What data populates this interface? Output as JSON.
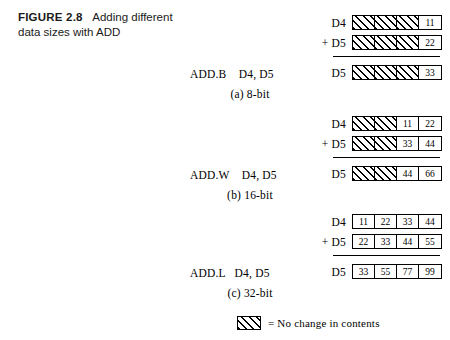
{
  "figure": {
    "number_label": "FIGURE 2.8",
    "caption_text": "Adding different data sizes with ADD"
  },
  "groups": [
    {
      "id": "8-bit",
      "mnemonic": "ADD.B    D4, D5",
      "subcaption": "(a) 8-bit",
      "rows": [
        {
          "label": "D4",
          "cells": [
            {
              "value": "",
              "hatched": true
            },
            {
              "value": "",
              "hatched": true
            },
            {
              "value": "",
              "hatched": true
            },
            {
              "value": "11",
              "hatched": false
            }
          ]
        },
        {
          "label": "+ D5",
          "cells": [
            {
              "value": "",
              "hatched": true
            },
            {
              "value": "",
              "hatched": true
            },
            {
              "value": "",
              "hatched": true
            },
            {
              "value": "22",
              "hatched": false
            }
          ]
        },
        {
          "label": "D5",
          "cells": [
            {
              "value": "",
              "hatched": true
            },
            {
              "value": "",
              "hatched": true
            },
            {
              "value": "",
              "hatched": true
            },
            {
              "value": "33",
              "hatched": false
            }
          ]
        }
      ]
    },
    {
      "id": "16-bit",
      "mnemonic": "ADD.W    D4, D5",
      "subcaption": "(b) 16-bit",
      "rows": [
        {
          "label": "D4",
          "cells": [
            {
              "value": "",
              "hatched": true
            },
            {
              "value": "",
              "hatched": true
            },
            {
              "value": "11",
              "hatched": false
            },
            {
              "value": "22",
              "hatched": false
            }
          ]
        },
        {
          "label": "+ D5",
          "cells": [
            {
              "value": "",
              "hatched": true
            },
            {
              "value": "",
              "hatched": true
            },
            {
              "value": "33",
              "hatched": false
            },
            {
              "value": "44",
              "hatched": false
            }
          ]
        },
        {
          "label": "D5",
          "cells": [
            {
              "value": "",
              "hatched": true
            },
            {
              "value": "",
              "hatched": true
            },
            {
              "value": "44",
              "hatched": false
            },
            {
              "value": "66",
              "hatched": false
            }
          ]
        }
      ]
    },
    {
      "id": "32-bit",
      "mnemonic": "ADD.L   D4, D5",
      "subcaption": "(c) 32-bit",
      "rows": [
        {
          "label": "D4",
          "cells": [
            {
              "value": "11",
              "hatched": false
            },
            {
              "value": "22",
              "hatched": false
            },
            {
              "value": "33",
              "hatched": false
            },
            {
              "value": "44",
              "hatched": false
            }
          ]
        },
        {
          "label": "+ D5",
          "cells": [
            {
              "value": "22",
              "hatched": false
            },
            {
              "value": "33",
              "hatched": false
            },
            {
              "value": "44",
              "hatched": false
            },
            {
              "value": "55",
              "hatched": false
            }
          ]
        },
        {
          "label": "D5",
          "cells": [
            {
              "value": "33",
              "hatched": false
            },
            {
              "value": "55",
              "hatched": false
            },
            {
              "value": "77",
              "hatched": false
            },
            {
              "value": "99",
              "hatched": false
            }
          ]
        }
      ]
    }
  ],
  "legend": {
    "text": "= No change in contents"
  },
  "colors": {
    "ink": "#000000",
    "paper": "#ffffff"
  }
}
